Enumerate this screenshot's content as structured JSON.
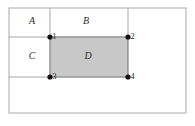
{
  "figure": {
    "background_color": "#ffffff",
    "frame": {
      "x": 9,
      "y": 8,
      "width": 177,
      "height": 105,
      "stroke_color": "#b8b8b8",
      "stroke_width": 1.2
    },
    "grid_stroke_color": "#a8a8a8",
    "grid_stroke_width": 1.0,
    "lines": [
      {
        "name": "vertical-left-divider",
        "x1": 50,
        "y1": 8,
        "x2": 50,
        "y2": 77
      },
      {
        "name": "vertical-right-divider",
        "x1": 128,
        "y1": 8,
        "x2": 128,
        "y2": 37
      },
      {
        "name": "horizontal-upper-divider",
        "x1": 9,
        "y1": 37,
        "x2": 128,
        "y2": 37
      },
      {
        "name": "horizontal-lower-divider",
        "x1": 9,
        "y1": 77,
        "x2": 128,
        "y2": 77
      }
    ],
    "shaded_rect": {
      "name": "region-D-shaded",
      "x": 50,
      "y": 37,
      "width": 78,
      "height": 40,
      "fill": "#c8c8c8",
      "stroke": "#6e6e6e",
      "stroke_width": 1.0
    },
    "region_labels": [
      {
        "id": "A",
        "text": "A",
        "x": 32,
        "y": 22
      },
      {
        "id": "B",
        "text": "B",
        "x": 86,
        "y": 22
      },
      {
        "id": "C",
        "text": "C",
        "x": 32,
        "y": 57
      },
      {
        "id": "D",
        "text": "D",
        "x": 88,
        "y": 57
      }
    ],
    "vertices": [
      {
        "id": "1",
        "text": "1",
        "cx": 50,
        "cy": 37,
        "r": 2.6,
        "label_dx": 2.5,
        "label_dy": 0.5
      },
      {
        "id": "2",
        "text": "2",
        "cx": 128,
        "cy": 37,
        "r": 2.6,
        "label_dx": 2.5,
        "label_dy": 0.5
      },
      {
        "id": "3",
        "text": "3",
        "cx": 50,
        "cy": 77,
        "r": 2.6,
        "label_dx": 2.5,
        "label_dy": 0.5
      },
      {
        "id": "4",
        "text": "4",
        "cx": 128,
        "cy": 77,
        "r": 2.6,
        "label_dx": 2.5,
        "label_dy": 0.5
      }
    ]
  }
}
